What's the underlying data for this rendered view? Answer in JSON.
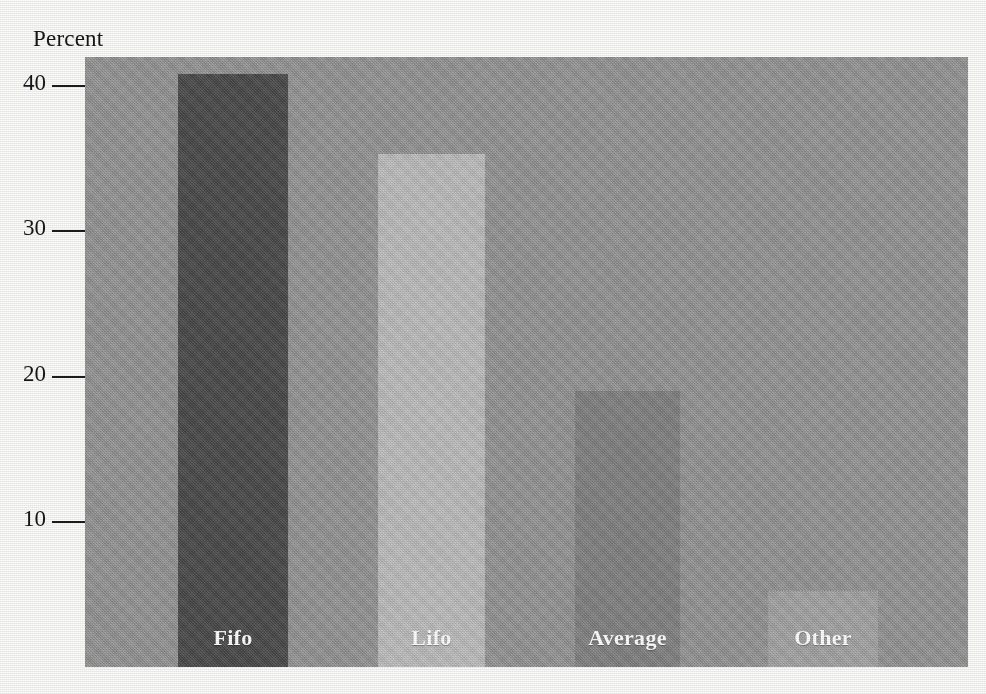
{
  "chart_data": {
    "type": "bar",
    "title": "",
    "subtitle": "",
    "xlabel": "",
    "ylabel": "Percent",
    "categories": [
      "Fifo",
      "Lifo",
      "Average",
      "Other"
    ],
    "values": [
      40.8,
      35.3,
      19.0,
      5.2
    ],
    "bar_colors": [
      "#4a4a4a",
      "#c2c2c2",
      "#848484",
      "#a8a8a8"
    ],
    "label_color": "#ffffff",
    "plot_background": "#969696",
    "figure_background": "#fdfdfc",
    "axis_text_color": "#17161a",
    "ylim": [
      0,
      42
    ],
    "yticks": [
      10,
      20,
      30,
      40
    ],
    "ytick_labels": [
      "10",
      "20",
      "30",
      "40"
    ],
    "grid": false,
    "legend": false,
    "legend_position": "none",
    "labels_inside_bars": true,
    "bars": [
      {
        "category": "Fifo",
        "value": 40.8,
        "color": "#4a4a4a",
        "label": "Fifo"
      },
      {
        "category": "Lifo",
        "value": 35.3,
        "color": "#c2c2c2",
        "label": "Lifo"
      },
      {
        "category": "Average",
        "value": 19.0,
        "color": "#848484",
        "label": "Average"
      },
      {
        "category": "Other",
        "value": 5.2,
        "color": "#a8a8a8",
        "label": "Other"
      }
    ]
  },
  "axis": {
    "y_title": "Percent",
    "ticks": [
      {
        "value": 40,
        "label": "40"
      },
      {
        "value": 30,
        "label": "30"
      },
      {
        "value": 20,
        "label": "20"
      },
      {
        "value": 10,
        "label": "10"
      }
    ]
  }
}
